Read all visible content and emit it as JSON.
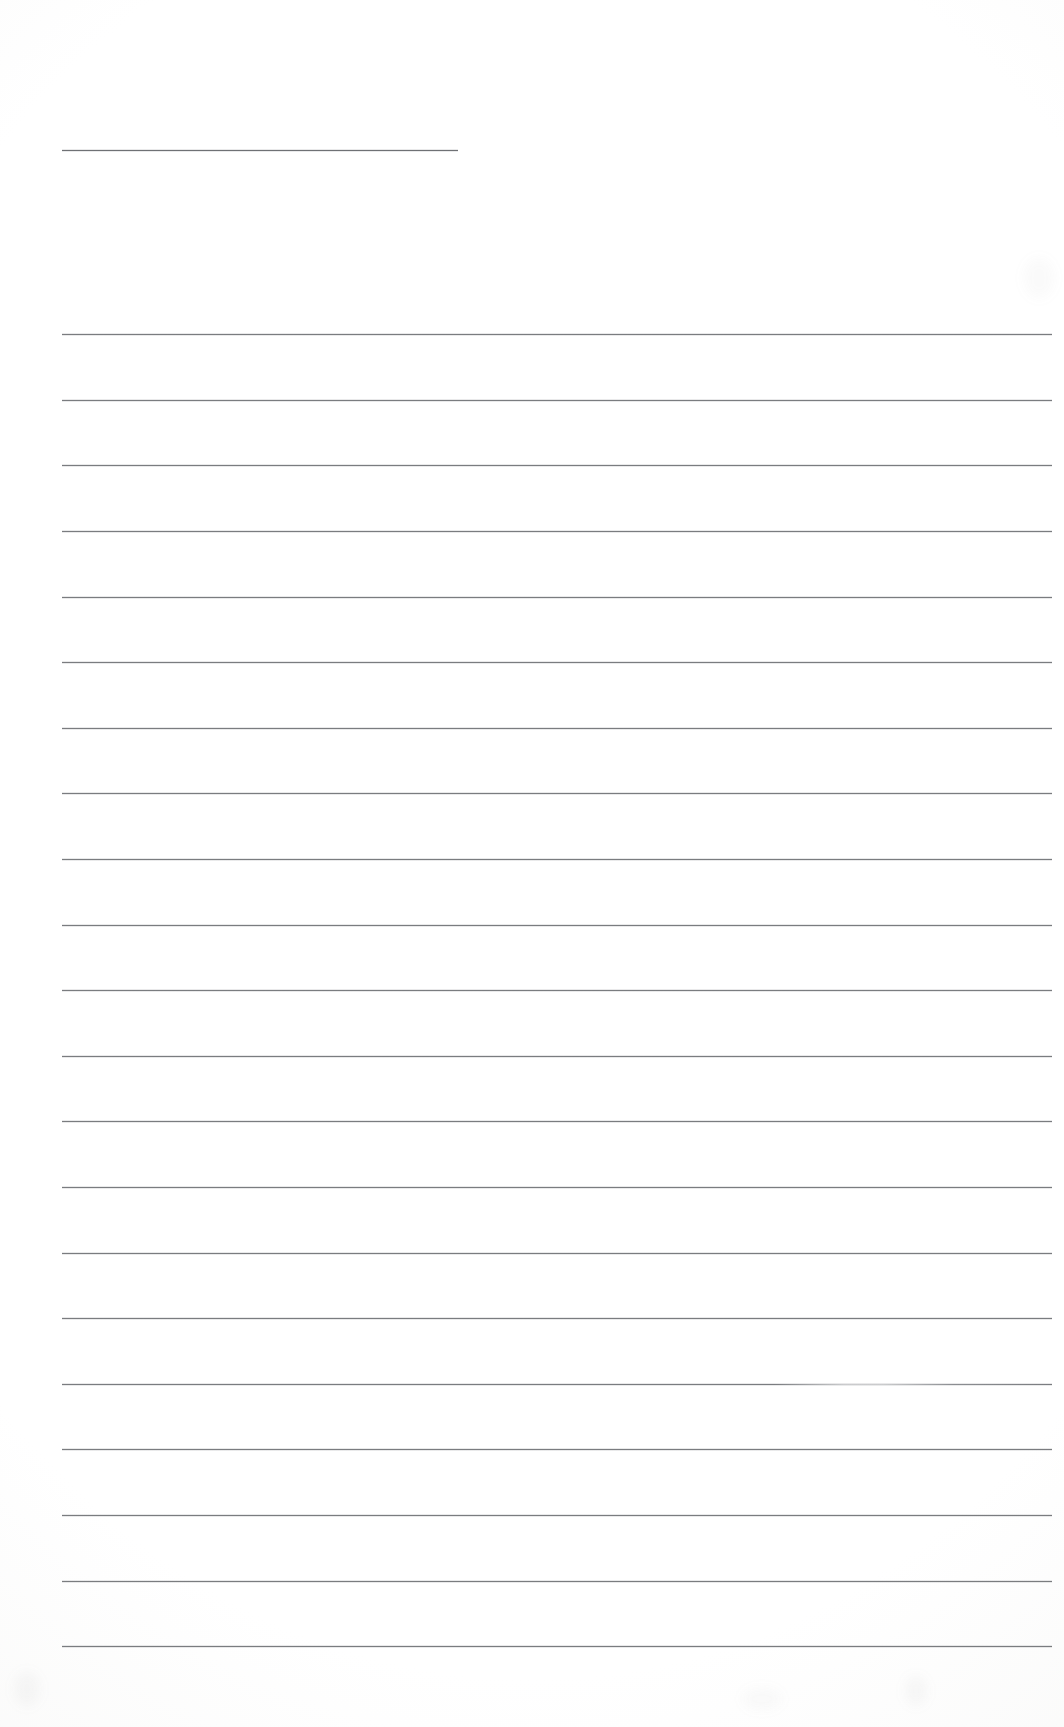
{
  "document": {
    "kind": "scanned-ruled-page",
    "title": "Blank ruled notebook page",
    "page_width": 1064,
    "page_height": 1727,
    "background_color": "#ffffff",
    "ink_color": "#6f7174",
    "content_text": "",
    "written_text": "none — the page is blank"
  },
  "header_rule": {
    "name": "header-rule",
    "x_start": 62,
    "x_end": 458,
    "y": 150,
    "length": 396,
    "color": "#5d5f62"
  },
  "body_rules": {
    "count": 21,
    "x_start": 62,
    "x_end": 1052,
    "length": 990,
    "first_y": 334,
    "spacing": 65.6,
    "color": "#6f7174",
    "lines": [
      {
        "index": 1,
        "y": 334,
        "style": "solid"
      },
      {
        "index": 2,
        "y": 400,
        "style": "solid"
      },
      {
        "index": 3,
        "y": 465,
        "style": "solid"
      },
      {
        "index": 4,
        "y": 531,
        "style": "solid"
      },
      {
        "index": 5,
        "y": 597,
        "style": "solid"
      },
      {
        "index": 6,
        "y": 662,
        "style": "solid"
      },
      {
        "index": 7,
        "y": 728,
        "style": "solid"
      },
      {
        "index": 8,
        "y": 793,
        "style": "solid"
      },
      {
        "index": 9,
        "y": 859,
        "style": "solid"
      },
      {
        "index": 10,
        "y": 925,
        "style": "solid"
      },
      {
        "index": 11,
        "y": 990,
        "style": "solid"
      },
      {
        "index": 12,
        "y": 1056,
        "style": "solid"
      },
      {
        "index": 13,
        "y": 1121,
        "style": "solid"
      },
      {
        "index": 14,
        "y": 1187,
        "style": "solid"
      },
      {
        "index": 15,
        "y": 1253,
        "style": "solid"
      },
      {
        "index": 16,
        "y": 1318,
        "style": "solid"
      },
      {
        "index": 17,
        "y": 1384,
        "style": "faded-mid"
      },
      {
        "index": 18,
        "y": 1449,
        "style": "solid"
      },
      {
        "index": 19,
        "y": 1515,
        "style": "solid"
      },
      {
        "index": 20,
        "y": 1581,
        "style": "solid"
      },
      {
        "index": 21,
        "y": 1646,
        "style": "solid"
      }
    ]
  },
  "artifacts": {
    "smudges": [
      {
        "name": "smudge-bottom-left",
        "x": 14,
        "y": 1672,
        "w": 26,
        "h": 34,
        "opacity": 0.05
      },
      {
        "name": "smudge-bottom-center",
        "x": 742,
        "y": 1688,
        "w": 40,
        "h": 22,
        "opacity": 0.04
      },
      {
        "name": "smudge-bottom-right",
        "x": 905,
        "y": 1676,
        "w": 22,
        "h": 30,
        "opacity": 0.05
      },
      {
        "name": "smudge-top-right",
        "x": 1024,
        "y": 258,
        "w": 30,
        "h": 40,
        "opacity": 0.04
      }
    ]
  }
}
